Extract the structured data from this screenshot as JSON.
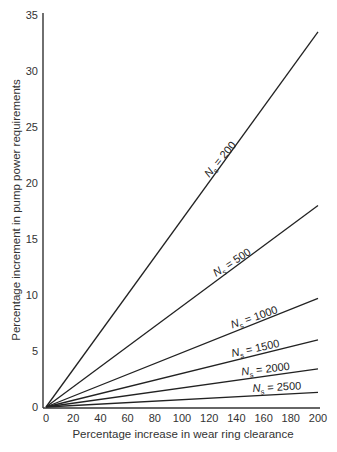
{
  "chart_data": {
    "type": "line",
    "title": "",
    "xlabel": "Percentage increase in wear ring clearance",
    "ylabel": "Percentage increment in pump power requirements",
    "xlim": [
      0,
      200
    ],
    "ylim": [
      0,
      35
    ],
    "x_ticks": [
      0,
      20,
      40,
      60,
      80,
      100,
      120,
      140,
      160,
      180,
      200
    ],
    "y_ticks": [
      0,
      5,
      10,
      15,
      20,
      25,
      30,
      35
    ],
    "grid": false,
    "legend": "inline labels on lines",
    "x": [
      0,
      200
    ],
    "series": [
      {
        "name": "N_s = 200",
        "label_main": "N",
        "label_sub": "s",
        "label_rest": " = 200",
        "values": [
          0,
          33.5
        ],
        "label_x": 120,
        "label_angle": -50
      },
      {
        "name": "N_s = 500",
        "label_main": "N",
        "label_sub": "s",
        "label_rest": " = 500",
        "values": [
          0,
          18.0
        ],
        "label_x": 125,
        "label_angle": -33
      },
      {
        "name": "N_s = 1000",
        "label_main": "N",
        "label_sub": "s",
        "label_rest": " = 1000",
        "values": [
          0,
          9.7
        ],
        "label_x": 137,
        "label_angle": -19
      },
      {
        "name": "N_s = 1500",
        "label_main": "N",
        "label_sub": "s",
        "label_rest": " = 1500",
        "values": [
          0,
          6.0
        ],
        "label_x": 137,
        "label_angle": -12
      },
      {
        "name": "N_s = 2000",
        "label_main": "N",
        "label_sub": "s",
        "label_rest": " = 2000",
        "values": [
          0,
          3.4
        ],
        "label_x": 144,
        "label_angle": -7
      },
      {
        "name": "N_s = 2500",
        "label_main": "N",
        "label_sub": "s",
        "label_rest": " = 2500",
        "values": [
          0,
          1.3
        ],
        "label_x": 152,
        "label_angle": -3
      }
    ]
  }
}
